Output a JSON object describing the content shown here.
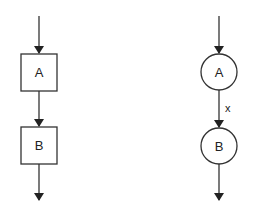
{
  "diagram": {
    "type": "flow-comparison",
    "left": {
      "style": "boxes",
      "nodes": [
        {
          "id": "A",
          "label": "A",
          "shape": "square"
        },
        {
          "id": "B",
          "label": "B",
          "shape": "square"
        }
      ],
      "edges": [
        {
          "from": null,
          "to": "A",
          "label": ""
        },
        {
          "from": "A",
          "to": "B",
          "label": ""
        },
        {
          "from": "B",
          "to": null,
          "label": ""
        }
      ]
    },
    "right": {
      "style": "circles",
      "nodes": [
        {
          "id": "A",
          "label": "A",
          "shape": "circle"
        },
        {
          "id": "B",
          "label": "B",
          "shape": "circle"
        }
      ],
      "edges": [
        {
          "from": null,
          "to": "A",
          "label": ""
        },
        {
          "from": "A",
          "to": "B",
          "label": "x"
        },
        {
          "from": "B",
          "to": null,
          "label": ""
        }
      ]
    },
    "colors": {
      "stroke": "#333333",
      "text": "#222222",
      "background": "#ffffff"
    }
  }
}
